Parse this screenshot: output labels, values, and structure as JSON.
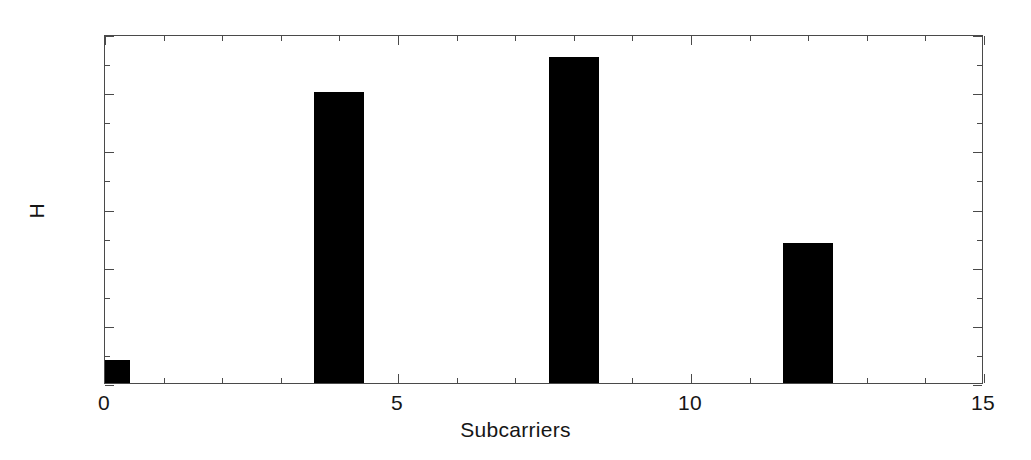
{
  "chart_data": {
    "type": "bar",
    "title": "",
    "xlabel": "Subcarriers",
    "ylabel": "H",
    "x": [
      0,
      4,
      8,
      12
    ],
    "values": [
      0.2,
      2.5,
      2.8,
      1.2
    ],
    "categories": [
      "0",
      "4",
      "8",
      "12"
    ],
    "bar_width": 0.85,
    "bar_color": "#000000",
    "xlim": [
      0,
      15
    ],
    "ylim": [
      0,
      3
    ],
    "xticks": [
      0,
      5,
      10,
      15
    ],
    "xtick_labels": [
      "0",
      "5",
      "10",
      "15"
    ],
    "x_minor_ticks": [
      1,
      2,
      3,
      4,
      6,
      7,
      8,
      9,
      11,
      12,
      13,
      14
    ],
    "yticks": [
      0,
      0.5,
      1,
      1.5,
      2,
      2.5,
      3
    ],
    "ytick_labels": [
      "0",
      "0.5",
      "1",
      "1.5",
      "2",
      "2.5",
      "3"
    ],
    "y_minor_ticks": [
      0.25,
      0.75,
      1.25,
      1.75,
      2.25,
      2.75
    ],
    "grid": false,
    "legend": null,
    "background_color": "#ffffff",
    "axis_color": "#4a4a4a"
  }
}
